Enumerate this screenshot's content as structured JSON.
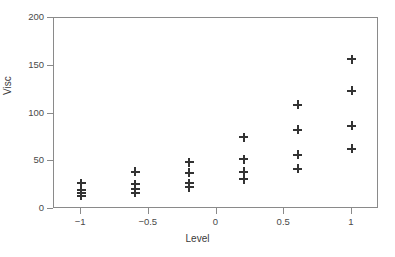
{
  "chart_data": {
    "type": "scatter",
    "title": "",
    "xlabel": "Level",
    "ylabel": "Visc",
    "xlim": [
      -1.2,
      1.2
    ],
    "ylim": [
      0,
      200
    ],
    "grid": false,
    "legend": null,
    "marker": "plus",
    "marker_color": "#333333",
    "frame_color": "#8a8a8a",
    "xticks": [
      -1,
      -0.5,
      0,
      0.5,
      1
    ],
    "xtick_labels": [
      "−1",
      "−0.5",
      "0",
      "0.5",
      "1"
    ],
    "yticks": [
      0,
      50,
      100,
      150,
      200
    ],
    "ytick_labels": [
      "0",
      "50",
      "100",
      "150",
      "200"
    ],
    "points": [
      {
        "x": -1.0,
        "y": 27
      },
      {
        "x": -1.0,
        "y": 20
      },
      {
        "x": -1.0,
        "y": 17
      },
      {
        "x": -1.0,
        "y": 14
      },
      {
        "x": -0.6,
        "y": 39
      },
      {
        "x": -0.6,
        "y": 26
      },
      {
        "x": -0.6,
        "y": 21
      },
      {
        "x": -0.6,
        "y": 17
      },
      {
        "x": -0.2,
        "y": 49
      },
      {
        "x": -0.2,
        "y": 38
      },
      {
        "x": -0.2,
        "y": 27
      },
      {
        "x": -0.2,
        "y": 23
      },
      {
        "x": 0.2,
        "y": 75
      },
      {
        "x": 0.2,
        "y": 52
      },
      {
        "x": 0.2,
        "y": 39
      },
      {
        "x": 0.2,
        "y": 31
      },
      {
        "x": 0.6,
        "y": 109
      },
      {
        "x": 0.6,
        "y": 83
      },
      {
        "x": 0.6,
        "y": 57
      },
      {
        "x": 0.6,
        "y": 42
      },
      {
        "x": 1.0,
        "y": 157
      },
      {
        "x": 1.0,
        "y": 124
      },
      {
        "x": 1.0,
        "y": 87
      },
      {
        "x": 1.0,
        "y": 63
      }
    ]
  }
}
